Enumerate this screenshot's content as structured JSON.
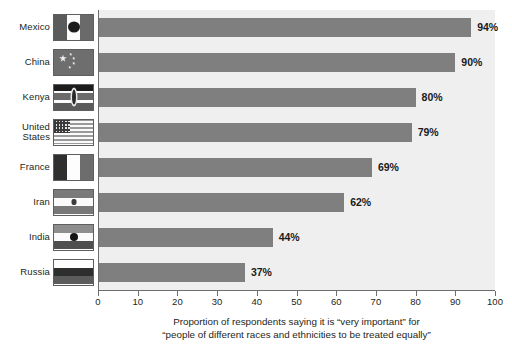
{
  "chart_data": {
    "type": "bar",
    "orientation": "horizontal",
    "title": "",
    "subtitle": "",
    "xlabel": "",
    "ylabel": "",
    "xlim": [
      0,
      100
    ],
    "xticks": [
      0,
      10,
      20,
      30,
      40,
      50,
      60,
      70,
      80,
      90,
      100
    ],
    "grid": false,
    "legend": null,
    "value_suffix": "%",
    "categories": [
      "Mexico",
      "China",
      "Kenya",
      "United\nStates",
      "France",
      "Iran",
      "India",
      "Russia"
    ],
    "values": [
      94,
      90,
      80,
      79,
      69,
      62,
      44,
      37
    ],
    "data_labels": [
      "94%",
      "90%",
      "80%",
      "79%",
      "69%",
      "62%",
      "44%",
      "37%"
    ],
    "caption_lines": [
      "Proportion of respondents saying it is “very important” for",
      "“people of different races and ethnicities to be treated equally”"
    ]
  },
  "colors": {
    "bar": "#7f7f7f",
    "plot_background": "#efefef",
    "page_background": "#ffffff",
    "axis": "#6d6d6d",
    "text": "#231f20"
  },
  "flags": [
    {
      "country": "Mexico",
      "icon": "flag-mexico-icon"
    },
    {
      "country": "China",
      "icon": "flag-china-icon"
    },
    {
      "country": "Kenya",
      "icon": "flag-kenya-icon"
    },
    {
      "country": "United States",
      "icon": "flag-united-states-icon"
    },
    {
      "country": "France",
      "icon": "flag-france-icon"
    },
    {
      "country": "Iran",
      "icon": "flag-iran-icon"
    },
    {
      "country": "India",
      "icon": "flag-india-icon"
    },
    {
      "country": "Russia",
      "icon": "flag-russia-icon"
    }
  ]
}
